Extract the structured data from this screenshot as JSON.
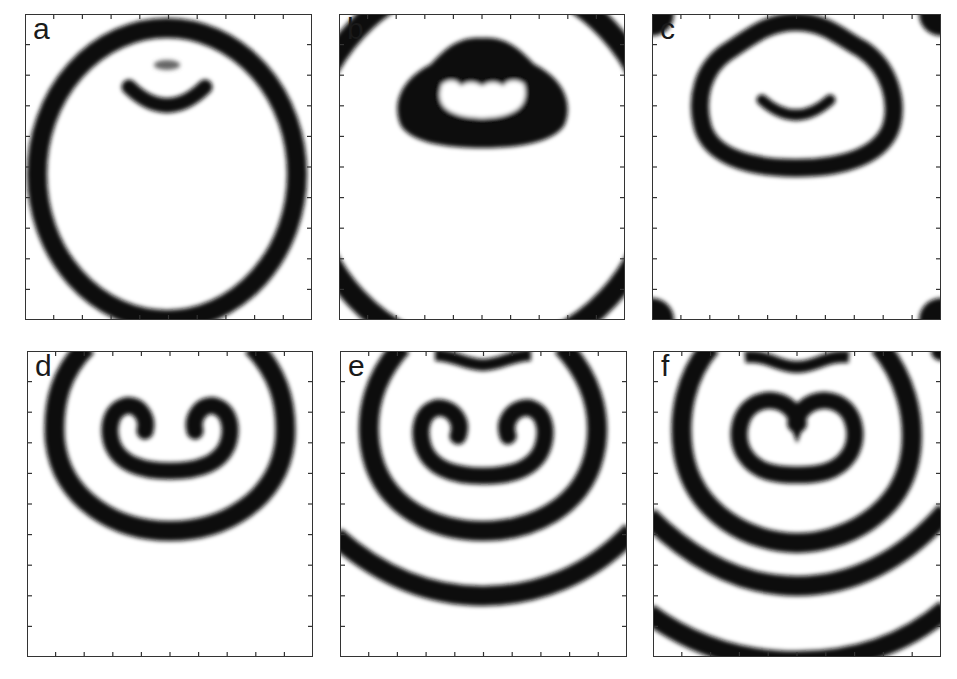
{
  "figure": {
    "ticks_per_axis": 9,
    "colors": {
      "wave": "#111111",
      "background": "#ffffff",
      "frame": "#333333"
    },
    "panels": [
      {
        "label": "a",
        "content": "large circular ring with small arc fragment and faint gray spot near top center"
      },
      {
        "label": "b",
        "content": "dark blob with inner light kidney-shaped region near top; ring arcs cutting corners"
      },
      {
        "label": "c",
        "content": "closed loop (egg-shaped) around a small arc near top; dark patches at four corners"
      },
      {
        "label": "d",
        "content": "pair of counter-rotating spiral tips inside an elliptical wave"
      },
      {
        "label": "e",
        "content": "pair of spirals with two surrounding wave fronts"
      },
      {
        "label": "f",
        "content": "merged spiral pair with three surrounding concentric wave fronts"
      }
    ]
  }
}
